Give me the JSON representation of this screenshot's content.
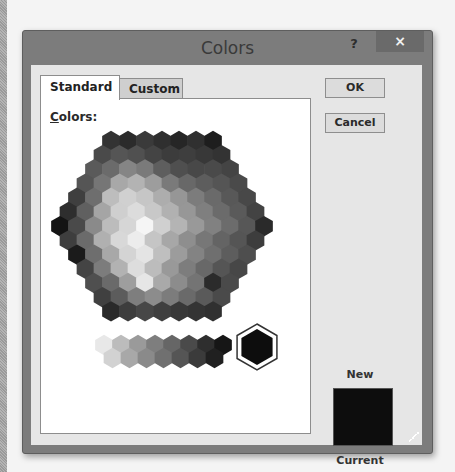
{
  "dialog": {
    "title": "Colors",
    "help_label": "?",
    "close_label": "×",
    "tabs": [
      {
        "label": "Standard",
        "active": true
      },
      {
        "label": "Custom",
        "active": false
      }
    ],
    "colors_label_mnemonic": "C",
    "colors_label_rest": "olors:",
    "buttons": {
      "ok": "OK",
      "cancel": "Cancel"
    },
    "preview": {
      "new_label": "New",
      "current_label": "Current",
      "new_color": "#0d0d0d",
      "current_color": "#0d0d0d"
    },
    "selected_color": "#0d0d0d"
  },
  "palette": {
    "rows": [
      [
        "#333333",
        "#2b2b2b",
        "#3a3a3a",
        "#2f2f2f",
        "#262626",
        "#303030",
        "#1e1e1e"
      ],
      [
        "#4a4a4a",
        "#555555",
        "#505050",
        "#444444",
        "#3c3c3c",
        "#3e3e3e",
        "#383838",
        "#333333"
      ],
      [
        "#5a5a5a",
        "#6b6b6b",
        "#858585",
        "#7a7a7a",
        "#5e5e5e",
        "#4f4f4f",
        "#484848",
        "#4a4a4a",
        "#444444"
      ],
      [
        "#555555",
        "#767676",
        "#a8a8a8",
        "#b3b3b3",
        "#9d9d9d",
        "#7a7a7a",
        "#686868",
        "#5d5d5d",
        "#555555",
        "#4a4a4a"
      ],
      [
        "#3f3f3f",
        "#6e6e6e",
        "#bdbdbd",
        "#d0d0d0",
        "#c6c6c6",
        "#adadad",
        "#969696",
        "#7c7c7c",
        "#6a6a6a",
        "#585858",
        "#484848"
      ],
      [
        "#2e2e2e",
        "#606060",
        "#a5a5a5",
        "#cfcfcf",
        "#dcdcdc",
        "#c8c8c8",
        "#b1b1b1",
        "#979797",
        "#7f7f7f",
        "#6b6b6b",
        "#5a5a5a",
        "#434343"
      ],
      [
        "#141414",
        "#4a4a4a",
        "#8a8a8a",
        "#bcbcbc",
        "#d6d6d6",
        "#f5f5f5",
        "#d0d0d0",
        "#b4b4b4",
        "#999999",
        "#818181",
        "#6c6c6c",
        "#575757",
        "#2a2a2a"
      ],
      [
        "#3e3e3e",
        "#6b6b6b",
        "#b0b0b0",
        "#d8d8d8",
        "#ececec",
        "#c5c5c5",
        "#a7a7a7",
        "#8e8e8e",
        "#777777",
        "#646464",
        "#555555",
        "#3d3d3d"
      ],
      [
        "#1b1b1b",
        "#6e6e6e",
        "#a8a8a8",
        "#d4d4d4",
        "#e4e4e4",
        "#bfbfbf",
        "#9c9c9c",
        "#838383",
        "#6f6f6f",
        "#5d5d5d",
        "#4e4e4e"
      ],
      [
        "#444444",
        "#7c7c7c",
        "#b2b2b2",
        "#dddddd",
        "#bcbcbc",
        "#999999",
        "#7d7d7d",
        "#686868",
        "#555555",
        "#474747"
      ],
      [
        "#4f4f4f",
        "#6a6a6a",
        "#9e9e9e",
        "#e6e6e6",
        "#a9a9a9",
        "#8c8c8c",
        "#747474",
        "#2b2b2b",
        "#4a4a4a"
      ],
      [
        "#404040",
        "#5c5c5c",
        "#7e7e7e",
        "#8c8c8c",
        "#7c7c7c",
        "#6a6a6a",
        "#5a5a5a",
        "#4a4a4a"
      ],
      [
        "#2a2a2a",
        "#3d3d3d",
        "#474747",
        "#3f3f3f",
        "#383838",
        "#343434",
        "#303030"
      ]
    ],
    "grays_top": [
      "#e8e8e8",
      "#bcbcbc",
      "#9a9a9a",
      "#7e7e7e",
      "#666666",
      "#4a4a4a",
      "#2e2e2e",
      "#161616"
    ],
    "grays_bottom": [
      "#d2d2d2",
      "#a8a8a8",
      "#8a8a8a",
      "#707070",
      "#555555",
      "#3b3b3b",
      "#202020"
    ]
  }
}
